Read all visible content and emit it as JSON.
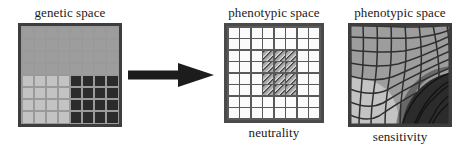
{
  "figure": {
    "title_genetic": "genetic space",
    "title_phenotypic_mid": "phenotypic space",
    "title_phenotypic_right": "phenotypic space",
    "caption_neutrality": "neutrality",
    "caption_sensitivity": "sensitivity",
    "arrow_name": "right-arrow"
  },
  "colors": {
    "background": "#ffffff",
    "text": "#1a1a1a",
    "grid_line_dark": "#3d3d3d",
    "genetic_mid_gray": "#9d9d9d",
    "genetic_light_gray": "#c3c3c3",
    "genetic_dark": "#2b2b2b",
    "neutral_cell_white": "#fbfbfb",
    "neutral_cell_hatched": "#8e8e8e",
    "sens_light": "#c3c3c3",
    "sens_mid": "#9d9d9d",
    "sens_dark": "#2b2b2b",
    "arrow_fill": "#1c1c1c"
  },
  "grids": {
    "genetic": {
      "rows": 8,
      "cols": 8,
      "cells": [
        [
          "mid",
          "mid",
          "mid",
          "mid",
          "mid",
          "mid",
          "mid",
          "mid"
        ],
        [
          "mid",
          "mid",
          "mid",
          "mid",
          "mid",
          "mid",
          "mid",
          "mid"
        ],
        [
          "mid",
          "mid",
          "mid",
          "mid",
          "mid",
          "mid",
          "mid",
          "mid"
        ],
        [
          "mid",
          "mid",
          "mid",
          "mid",
          "mid",
          "mid",
          "mid",
          "mid"
        ],
        [
          "light",
          "light",
          "light",
          "light",
          "dark",
          "dark",
          "dark",
          "dark"
        ],
        [
          "light",
          "light",
          "light",
          "light",
          "dark",
          "dark",
          "dark",
          "dark"
        ],
        [
          "light",
          "light",
          "light",
          "light",
          "dark",
          "dark",
          "dark",
          "dark"
        ],
        [
          "light",
          "light",
          "light",
          "light",
          "dark",
          "dark",
          "dark",
          "dark"
        ]
      ]
    },
    "neutrality": {
      "rows": 8,
      "cols": 8,
      "cells": [
        [
          "plain",
          "plain",
          "plain",
          "plain",
          "plain",
          "plain",
          "plain",
          "plain"
        ],
        [
          "plain",
          "plain",
          "plain",
          "plain",
          "plain",
          "plain",
          "plain",
          "plain"
        ],
        [
          "plain",
          "plain",
          "plain",
          "hatched",
          "hatched",
          "hatched",
          "plain",
          "plain"
        ],
        [
          "plain",
          "plain",
          "plain",
          "hatched",
          "hatched",
          "hatched",
          "plain",
          "plain"
        ],
        [
          "plain",
          "plain",
          "plain",
          "hatched",
          "hatched",
          "hatched",
          "plain",
          "plain"
        ],
        [
          "plain",
          "plain",
          "plain",
          "hatched",
          "hatched",
          "hatched",
          "plain",
          "plain"
        ],
        [
          "plain",
          "plain",
          "plain",
          "plain",
          "plain",
          "plain",
          "plain",
          "plain"
        ],
        [
          "plain",
          "plain",
          "plain",
          "plain",
          "plain",
          "plain",
          "plain",
          "plain"
        ]
      ]
    },
    "sensitivity": {
      "rows": 8,
      "cols": 8,
      "description": "warped curvilinear grid, light-gray lower-left region, mid-gray upper region, dark region lower-right"
    }
  }
}
